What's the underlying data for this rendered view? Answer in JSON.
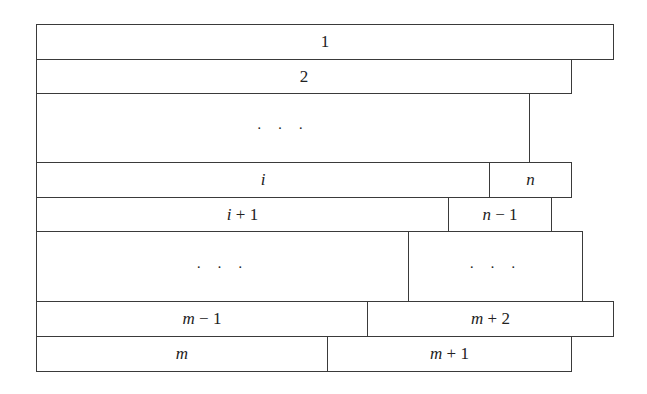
{
  "diagram": {
    "type": "stacked-strip-packing",
    "line_color": "#3a3a3a",
    "background": "#ffffff",
    "boxes": [
      {
        "id": "box-1",
        "var": "",
        "op": "",
        "num": "1",
        "x": 36,
        "y": 24,
        "w": 578,
        "h": 36
      },
      {
        "id": "box-2",
        "var": "",
        "op": "",
        "num": "2",
        "x": 36,
        "y": 59,
        "w": 536,
        "h": 35
      },
      {
        "id": "box-dots-top",
        "dots": "· · ·",
        "x": 36,
        "y": 93,
        "w": 494,
        "h": 70
      },
      {
        "id": "box-i",
        "var": "i",
        "op": "",
        "num": "",
        "x": 36,
        "y": 162,
        "w": 454,
        "h": 36
      },
      {
        "id": "box-n",
        "var": "n",
        "op": "",
        "num": "",
        "x": 489,
        "y": 162,
        "w": 83,
        "h": 36
      },
      {
        "id": "box-i-plus-1",
        "var": "i",
        "op": " + ",
        "num": "1",
        "x": 36,
        "y": 197,
        "w": 413,
        "h": 35
      },
      {
        "id": "box-n-minus-1",
        "var": "n",
        "op": " − ",
        "num": "1",
        "x": 448,
        "y": 197,
        "w": 104,
        "h": 35
      },
      {
        "id": "box-dots-left",
        "dots": "· · ·",
        "x": 36,
        "y": 231,
        "w": 373,
        "h": 71
      },
      {
        "id": "box-dots-right",
        "dots": "· · ·",
        "x": 408,
        "y": 231,
        "w": 175,
        "h": 71
      },
      {
        "id": "box-m-minus-1",
        "var": "m",
        "op": " − ",
        "num": "1",
        "x": 36,
        "y": 301,
        "w": 332,
        "h": 36
      },
      {
        "id": "box-m-plus-2",
        "var": "m",
        "op": " + ",
        "num": "2",
        "x": 367,
        "y": 301,
        "w": 247,
        "h": 36
      },
      {
        "id": "box-m",
        "var": "m",
        "op": "",
        "num": "",
        "x": 36,
        "y": 336,
        "w": 292,
        "h": 36
      },
      {
        "id": "box-m-plus-1",
        "var": "m",
        "op": " + ",
        "num": "1",
        "x": 327,
        "y": 336,
        "w": 245,
        "h": 36
      }
    ]
  }
}
